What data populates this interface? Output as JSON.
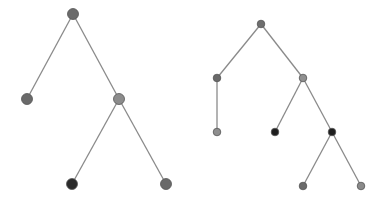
{
  "diagram": {
    "title": "",
    "edge_color": "#8a8a8a",
    "trees": [
      {
        "name": "tree-left",
        "node_radius": 5.5,
        "nodes": [
          {
            "id": "root",
            "x": 73,
            "y": 14,
            "fill": "#6b6b6b"
          },
          {
            "id": "l",
            "x": 27,
            "y": 99,
            "fill": "#6a6a6a"
          },
          {
            "id": "r",
            "x": 119,
            "y": 99,
            "fill": "#8c8c8c"
          },
          {
            "id": "rl",
            "x": 72,
            "y": 184,
            "fill": "#2a2a2a"
          },
          {
            "id": "rr",
            "x": 166,
            "y": 184,
            "fill": "#6a6a6a"
          }
        ],
        "edges": [
          [
            "root",
            "l"
          ],
          [
            "root",
            "r"
          ],
          [
            "r",
            "rl"
          ],
          [
            "r",
            "rr"
          ]
        ]
      },
      {
        "name": "tree-right",
        "node_radius": 3.8,
        "nodes": [
          {
            "id": "root",
            "x": 261,
            "y": 24,
            "fill": "#6e6e6e"
          },
          {
            "id": "a",
            "x": 217,
            "y": 78,
            "fill": "#6a6a6a"
          },
          {
            "id": "b",
            "x": 303,
            "y": 78,
            "fill": "#909090"
          },
          {
            "id": "a1",
            "x": 217,
            "y": 132,
            "fill": "#8e8e8e"
          },
          {
            "id": "b1",
            "x": 275,
            "y": 132,
            "fill": "#1e1e1e"
          },
          {
            "id": "b2",
            "x": 332,
            "y": 132,
            "fill": "#1e1e1e"
          },
          {
            "id": "b2l",
            "x": 303,
            "y": 186,
            "fill": "#6a6a6a"
          },
          {
            "id": "b2r",
            "x": 361,
            "y": 186,
            "fill": "#8a8a8a"
          }
        ],
        "edges": [
          [
            "root",
            "a"
          ],
          [
            "root",
            "b"
          ],
          [
            "a",
            "a1"
          ],
          [
            "b",
            "b1"
          ],
          [
            "b",
            "b2"
          ],
          [
            "b2",
            "b2l"
          ],
          [
            "b2",
            "b2r"
          ]
        ]
      }
    ]
  }
}
